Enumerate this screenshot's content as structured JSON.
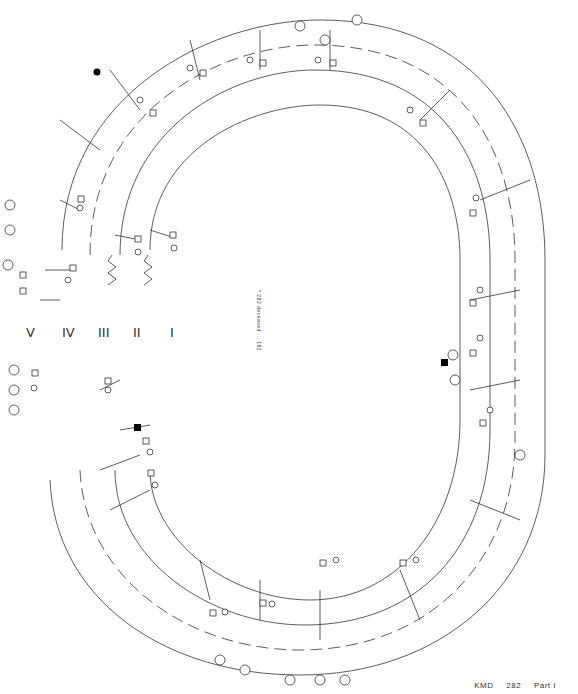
{
  "document": {
    "caption": {
      "id": "KMD",
      "number": "282",
      "part": "Part I"
    },
    "center_note": "* 282 deceased ... 182",
    "generation_markers": [
      "V",
      "IV",
      "III",
      "II",
      "I"
    ],
    "footer_fragment": "",
    "colors": {
      "line": "#333333",
      "affected": "#000000",
      "background": "#ffffff",
      "dash": "#555555"
    }
  },
  "pedigree": {
    "proband_labels": [
      "5"
    ],
    "left_individuals": [
      "2",
      "4",
      "22",
      "23",
      "163",
      "164",
      "185",
      "186",
      "187",
      "188",
      "389",
      "390",
      "391",
      "392",
      "393",
      "394",
      "395",
      "28",
      "29",
      "100",
      "101",
      "102",
      "103",
      "293",
      "294",
      "295",
      "296",
      "297",
      "298",
      "299",
      "300",
      "301",
      "302",
      "6",
      "7",
      "8",
      "9",
      "30",
      "31",
      "32",
      "33",
      "34",
      "35",
      "36",
      "104",
      "105",
      "106",
      "107",
      "303",
      "304",
      "108",
      "109",
      "110",
      "111"
    ],
    "top_individuals": [
      "192",
      "173",
      "174",
      "175",
      "176",
      "177",
      "178",
      "179",
      "180",
      "181",
      "182",
      "183",
      "184",
      "371",
      "372",
      "373",
      "374",
      "375",
      "376",
      "385",
      "386",
      "387"
    ],
    "right_individuals": [
      "48",
      "49",
      "50",
      "51",
      "52",
      "53",
      "54",
      "55",
      "56",
      "57",
      "58",
      "59",
      "60",
      "61",
      "142",
      "143",
      "144",
      "145",
      "146",
      "147",
      "148",
      "149",
      "150",
      "151",
      "152",
      "237",
      "238",
      "239",
      "240",
      "241",
      "242",
      "243",
      "244",
      "245",
      "246",
      "247",
      "248"
    ],
    "bottom_individuals": [
      "10",
      "11",
      "12",
      "13",
      "14",
      "15",
      "16",
      "17",
      "18",
      "19",
      "20",
      "37",
      "38",
      "39",
      "40",
      "41",
      "42",
      "43",
      "44",
      "45",
      "46",
      "47",
      "112",
      "113",
      "114",
      "115",
      "116",
      "117",
      "118",
      "119",
      "120",
      "121",
      "122",
      "123",
      "124",
      "125"
    ]
  }
}
